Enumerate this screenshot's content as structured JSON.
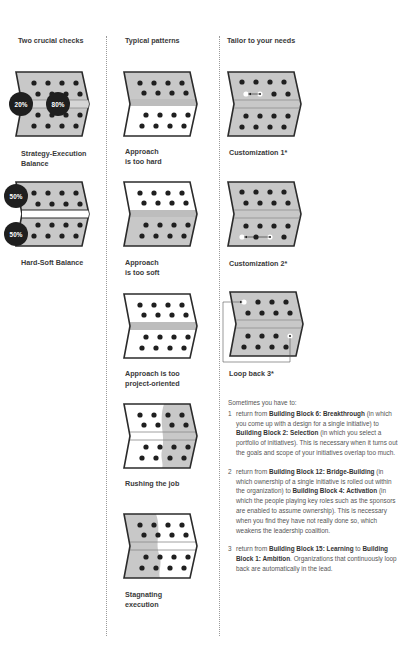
{
  "columns": [
    {
      "title": "Two crucial checks"
    },
    {
      "title": "Typical patterns"
    },
    {
      "title": "Tailor to your needs"
    }
  ],
  "checks": [
    {
      "caption_line1": "Strategy-Execution",
      "caption_line2": "Balance",
      "badges": [
        "20%",
        "80%"
      ]
    },
    {
      "caption_line1": "Hard-Soft Balance",
      "badges": [
        "50%",
        "50%"
      ]
    }
  ],
  "patterns": [
    {
      "caption_line1": "Approach",
      "caption_line2": "is too hard"
    },
    {
      "caption_line1": "Approach",
      "caption_line2": "is too soft"
    },
    {
      "caption_line1": "Approach is too",
      "caption_line2": "project-oriented"
    },
    {
      "caption_line1": "Rushing the job"
    },
    {
      "caption_line1": "Stagnating",
      "caption_line2": "execution"
    }
  ],
  "tailor": [
    {
      "caption": "Customization  1*"
    },
    {
      "caption": "Customization  2*"
    },
    {
      "caption": "Loop back  3*"
    }
  ],
  "notes": {
    "intro": "Sometimes you have to:",
    "items": [
      {
        "num": "1",
        "t1": "return from ",
        "b1": "Building Block 6: Breakthrough",
        "t2": " (in which you come up with a design for a single initiative) to ",
        "b2": "Building Block 2: Selection",
        "t3": " (in which you select a portfolio of initiatives). This is necessary when it turns out the goals and scope of your initiatives overlap too much."
      },
      {
        "num": "2",
        "t1": "return from ",
        "b1": "Building Block 12: Bridge-Building",
        "t2": " (in which ownership of a single initiative is rolled out within the organization) to ",
        "b2": "Building Block 4: Activation",
        "t3": " (in which the people playing key roles such as the sponsors are enabled to assume ownership). This is necessary when you find they have not really done so, which weakens the leadership coalition."
      },
      {
        "num": "3",
        "t1": "return from ",
        "b1": "Building Block 15: Learning",
        "t2": " to ",
        "b2": "Building Block 1: Ambition",
        "t3": ". Organizations that continuously loop back are automatically in the lead."
      }
    ]
  },
  "colors": {
    "gray_fill": "#c8c8c8",
    "outline": "#2b2b2b",
    "dot": "#1f1f1f",
    "badge": "#1f1f1f",
    "white": "#ffffff"
  }
}
